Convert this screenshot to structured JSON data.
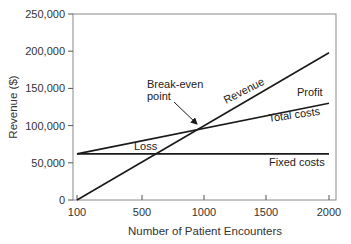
{
  "chart_data": {
    "type": "line",
    "title": "",
    "xlabel": "Number of Patient Encounters",
    "ylabel": "Revenue ($)",
    "xticks": [
      100,
      500,
      1000,
      1500,
      2000
    ],
    "xtick_labels": [
      "100",
      "500",
      "1000",
      "1500",
      "2000"
    ],
    "yticks": [
      0,
      50000,
      100000,
      150000,
      200000,
      250000
    ],
    "ytick_labels": [
      "0",
      "50,000",
      "100,000",
      "150,000",
      "200,000",
      "250,000"
    ],
    "xlim": [
      100,
      2000
    ],
    "ylim": [
      0,
      250000
    ],
    "grid": false,
    "series": [
      {
        "name": "Revenue",
        "x": [
          100,
          2000
        ],
        "y": [
          0,
          198000
        ]
      },
      {
        "name": "Total costs",
        "x": [
          100,
          2000
        ],
        "y": [
          62000,
          130000
        ]
      },
      {
        "name": "Fixed costs",
        "x": [
          100,
          2000
        ],
        "y": [
          62000,
          62000
        ]
      }
    ],
    "annotations": [
      {
        "text": "Break-even point",
        "x": 1000,
        "y": 96000,
        "arrow": true
      },
      {
        "text": "Revenue",
        "label_for": "Revenue"
      },
      {
        "text": "Profit",
        "region": "between Revenue and Total costs, right"
      },
      {
        "text": "Total costs",
        "label_for": "Total costs"
      },
      {
        "text": "Loss",
        "region": "between Total costs and Revenue, left"
      },
      {
        "text": "Fixed costs",
        "label_for": "Fixed costs"
      }
    ]
  }
}
